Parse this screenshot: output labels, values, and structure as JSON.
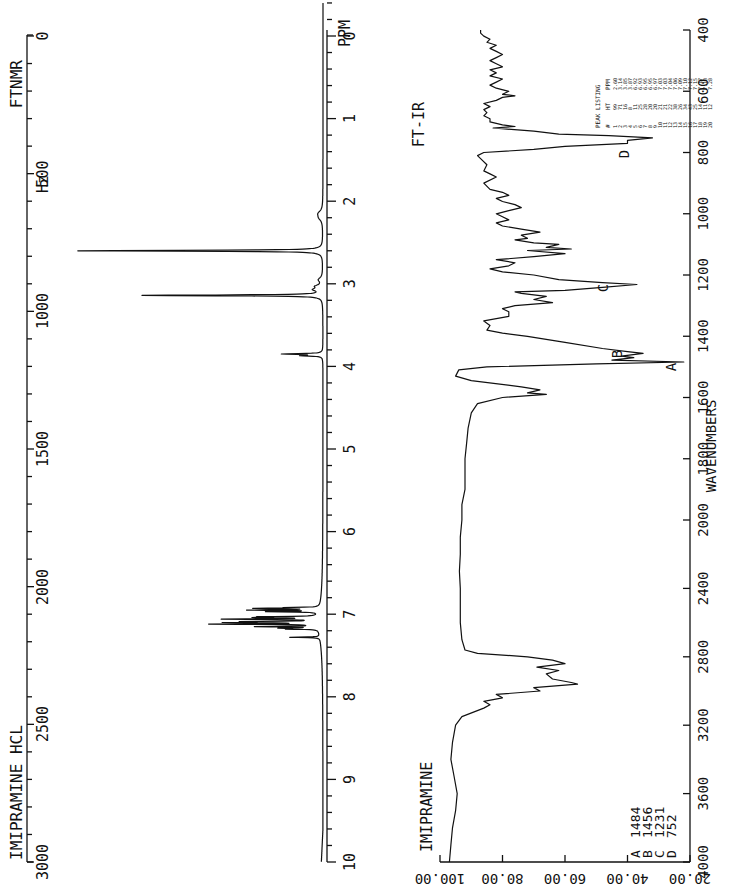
{
  "nmr": {
    "title": "FTNMR",
    "compound": "IMIPRAMINE HCL",
    "hz_unit": "Hz",
    "ppm_unit": "PPM",
    "hz_ticks": [
      "0",
      "500",
      "1000",
      "1500",
      "2000",
      "2500",
      "3000"
    ],
    "ppm_ticks": [
      "0",
      "1",
      "2",
      "3",
      "4",
      "5",
      "6",
      "7",
      "8",
      "9",
      "10"
    ],
    "peak_listing": {
      "title": "PEAK LISTING",
      "headers": [
        "#",
        "HT",
        "PPM"
      ],
      "rows": [
        [
          "1",
          "99",
          "2.60"
        ],
        [
          "2",
          "71",
          "3.14"
        ],
        [
          "3",
          "16",
          "3.85"
        ],
        [
          "4",
          "8",
          "3.87"
        ],
        [
          "5",
          "11",
          "6.92"
        ],
        [
          "6",
          "25",
          "6.93"
        ],
        [
          "7",
          "28",
          "6.95"
        ],
        [
          "8",
          "20",
          "6.95"
        ],
        [
          "9",
          "20",
          "6.97"
        ],
        [
          "10",
          "21",
          "7.03"
        ],
        [
          "11",
          "21",
          "7.03"
        ],
        [
          "12",
          "22",
          "7.04"
        ],
        [
          "13",
          "38",
          "7.06"
        ],
        [
          "14",
          "26",
          "7.09"
        ],
        [
          "15",
          "34",
          "7.10"
        ],
        [
          "16",
          "43",
          "7.12"
        ],
        [
          "17",
          "25",
          "7.15"
        ],
        [
          "18",
          "14",
          "7.17"
        ],
        [
          "19",
          "11",
          "7.18"
        ],
        [
          "20",
          "12",
          "7.28"
        ]
      ]
    }
  },
  "ir": {
    "title": "FT-IR",
    "compound": "IMIPRAMINE",
    "x_label": "WAVENUMBERS",
    "y_label": "TRANSMITTANCE",
    "x_ticks": [
      "400",
      "600",
      "800",
      "1000",
      "1200",
      "1400",
      "1600",
      "1800",
      "2000",
      "2400",
      "2800",
      "3200",
      "3600",
      "4000"
    ],
    "y_ticks": [
      "20.00",
      "40.00",
      "60.00",
      "80.00",
      "100.00"
    ],
    "peak_labels": [
      {
        "mark": "A",
        "wavenumber": "1484"
      },
      {
        "mark": "B",
        "wavenumber": "1456"
      },
      {
        "mark": "C",
        "wavenumber": "1231"
      },
      {
        "mark": "D",
        "wavenumber": "752"
      }
    ]
  },
  "chart_data": [
    {
      "type": "line",
      "title": "FTNMR — IMIPRAMINE HCL",
      "xlabel": "PPM",
      "x_secondary_label": "Hz",
      "xlim": [
        0,
        10
      ],
      "x_secondary_lim": [
        0,
        3000
      ],
      "ylabel": "",
      "peaks_ppm": [
        2.6,
        3.14,
        3.85,
        3.87,
        6.92,
        6.93,
        6.95,
        6.95,
        6.97,
        7.03,
        7.03,
        7.04,
        7.06,
        7.09,
        7.1,
        7.12,
        7.15,
        7.17,
        7.18,
        7.28
      ],
      "peak_heights": [
        99,
        71,
        16,
        8,
        11,
        25,
        28,
        20,
        20,
        21,
        21,
        22,
        38,
        26,
        34,
        43,
        25,
        14,
        11,
        12
      ]
    },
    {
      "type": "line",
      "title": "FT-IR — IMIPRAMINE",
      "xlabel": "WAVENUMBERS",
      "ylabel": "TRANSMITTANCE",
      "xlim": [
        4000,
        400
      ],
      "ylim": [
        20,
        100
      ],
      "labeled_peaks": [
        {
          "label": "A",
          "x": 1484,
          "y": 22
        },
        {
          "label": "B",
          "x": 1456,
          "y": 35
        },
        {
          "label": "C",
          "x": 1231,
          "y": 37
        },
        {
          "label": "D",
          "x": 752,
          "y": 32
        }
      ]
    }
  ]
}
